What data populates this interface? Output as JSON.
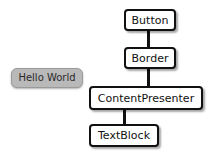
{
  "diagram": {
    "colors": {
      "node_border": "#111111",
      "node_fill": "#ffffff",
      "connector": "#111111",
      "rendered_button_fill": "#b9b9b9",
      "rendered_button_border": "#9a9a9a",
      "background": "#ffffff",
      "text": "#111111"
    },
    "rendered_sample": {
      "name": "hello-world-button",
      "label": "Hello World"
    },
    "nodes": [
      {
        "id": "button",
        "label": "Button"
      },
      {
        "id": "border",
        "label": "Border"
      },
      {
        "id": "contentpresenter",
        "label": "ContentPresenter"
      },
      {
        "id": "textblock",
        "label": "TextBlock"
      }
    ],
    "edges": [
      {
        "from": "Button",
        "to": "Border"
      },
      {
        "from": "Border",
        "to": "ContentPresenter"
      },
      {
        "from": "ContentPresenter",
        "to": "TextBlock"
      }
    ]
  }
}
